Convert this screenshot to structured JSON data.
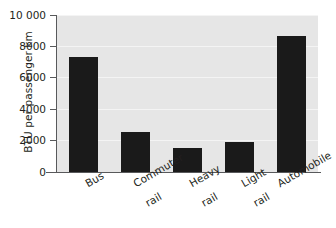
{
  "chart_data": {
    "type": "bar",
    "title": "",
    "subtitle": "",
    "xlabel": "",
    "ylabel": "BTU per passenger km",
    "categories": [
      "Bus",
      "Commuter rail",
      "Heavy rail",
      "Light rail",
      "Automobile"
    ],
    "values": [
      7300,
      2550,
      1500,
      1900,
      8650
    ],
    "ylim": [
      0,
      10000
    ],
    "yticks": [
      0,
      2000,
      4000,
      6000,
      8000,
      10000
    ],
    "ytick_labels": [
      "0",
      "2000",
      "4000",
      "6000",
      "8000",
      "10 000"
    ],
    "grid": true,
    "legend": null,
    "legend_position": "none",
    "bar_color": "#1a1a1a",
    "plot_background": "#e6e6e6",
    "gridline_color": "#f4f4f4",
    "axis_color": "#58595b",
    "series": [
      {
        "name": "BTU per passenger km",
        "values": [
          7300,
          2550,
          1500,
          1900,
          8650
        ]
      }
    ]
  },
  "axis": {
    "y_title": "BTU per passenger km",
    "tick_labels": [
      "10 000",
      "8000",
      "6000",
      "4000",
      "2000",
      "0"
    ]
  },
  "categories": [
    {
      "line1": "Bus",
      "line2": ""
    },
    {
      "line1": "Commuter",
      "line2": "rail"
    },
    {
      "line1": "Heavy",
      "line2": "rail"
    },
    {
      "line1": "Light",
      "line2": "rail"
    },
    {
      "line1": "Automobile",
      "line2": ""
    }
  ]
}
